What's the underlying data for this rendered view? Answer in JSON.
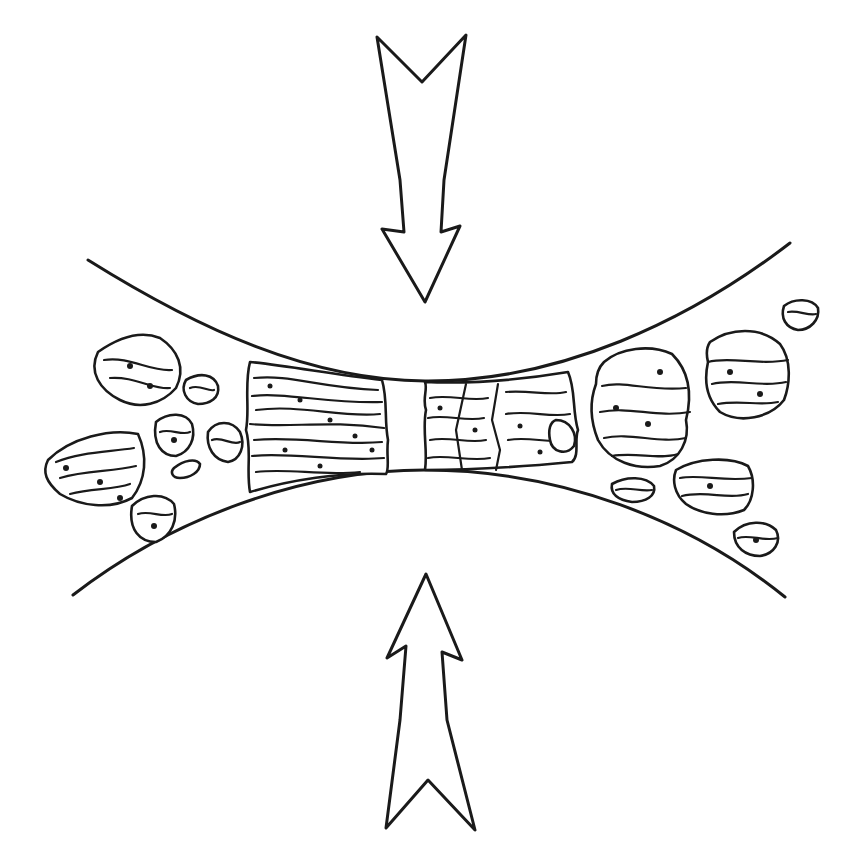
{
  "diagram": {
    "elements": {
      "arrow_top": {
        "direction": "down",
        "icon": "hollow-arrow-down"
      },
      "arrow_bottom": {
        "direction": "up",
        "icon": "hollow-arrow-up"
      },
      "upper_surface": {
        "shape": "concave curve"
      },
      "lower_surface": {
        "shape": "convex curve"
      },
      "compressed_zone": {
        "description": "compacted layered particles in the narrow gap, split by a gap and fractures"
      },
      "loose_particles_left": 9,
      "loose_particles_right": 7
    },
    "colors": {
      "line": "#1a1a1a",
      "background": "#ffffff"
    }
  }
}
